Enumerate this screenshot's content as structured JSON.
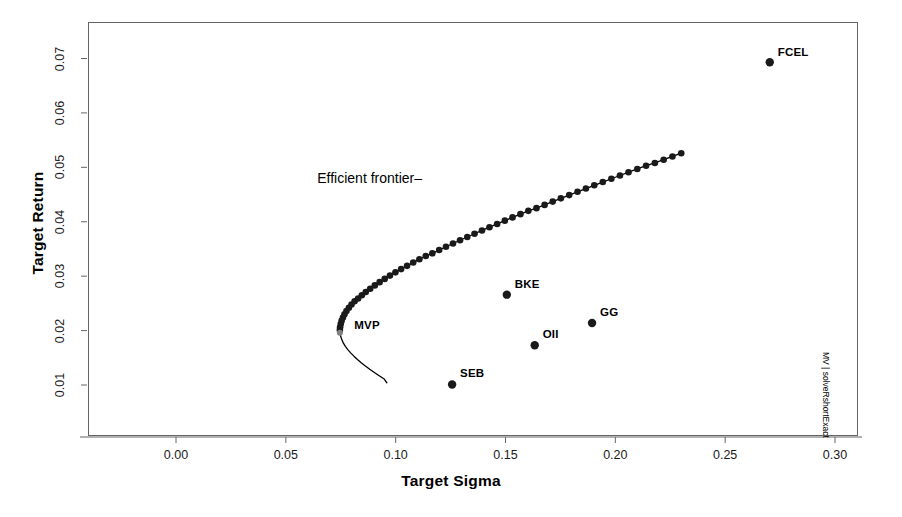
{
  "chart_data": {
    "type": "scatter",
    "title": "",
    "xlabel": "Target Sigma",
    "ylabel": "Target Return",
    "xlim": [
      -0.0398,
      0.3085
    ],
    "ylim": [
      0.0042,
      0.0742
    ],
    "xticks": [
      0.0,
      0.05,
      0.1,
      0.15,
      0.2,
      0.25,
      0.3
    ],
    "xticklabels": [
      "0.00",
      "0.05",
      "0.10",
      "0.15",
      "0.20",
      "0.25",
      "0.30"
    ],
    "yticks": [
      0.01,
      0.02,
      0.03,
      0.04,
      0.05,
      0.06,
      0.07
    ],
    "yticklabels": [
      "0.01",
      "0.02",
      "0.03",
      "0.04",
      "0.05",
      "0.06",
      "0.07"
    ],
    "grid": false,
    "legend": "none",
    "point_color": "#1a1a1a",
    "line_color": "#000000",
    "annotations": [
      {
        "name": "efficient-frontier-annotation",
        "text": "Efficient frontier–",
        "x": 0.112,
        "y": 0.0476,
        "anchor": "end"
      },
      {
        "name": "mvp-annotation",
        "text": "MVP",
        "x": 0.0775,
        "y": 0.0207,
        "anchor": "start"
      },
      {
        "name": "side-caption",
        "text": "MV | solveRshortExact"
      }
    ],
    "series": [
      {
        "name": "Efficient frontier",
        "kind": "line-with-markers",
        "marker": "filled-circle",
        "points": [
          [
            0.0746,
            0.0201
          ],
          [
            0.0747,
            0.0206
          ],
          [
            0.075,
            0.0212
          ],
          [
            0.0754,
            0.0218
          ],
          [
            0.076,
            0.0224
          ],
          [
            0.0767,
            0.023
          ],
          [
            0.0776,
            0.0236
          ],
          [
            0.0787,
            0.0242
          ],
          [
            0.0799,
            0.0248
          ],
          [
            0.0813,
            0.0254
          ],
          [
            0.0829,
            0.0259
          ],
          [
            0.0846,
            0.0265
          ],
          [
            0.0864,
            0.0271
          ],
          [
            0.0884,
            0.0277
          ],
          [
            0.0905,
            0.0283
          ],
          [
            0.0927,
            0.0289
          ],
          [
            0.095,
            0.0295
          ],
          [
            0.0974,
            0.0301
          ],
          [
            0.0999,
            0.0307
          ],
          [
            0.1025,
            0.0313
          ],
          [
            0.1052,
            0.0319
          ],
          [
            0.108,
            0.0325
          ],
          [
            0.1108,
            0.0331
          ],
          [
            0.1137,
            0.0337
          ],
          [
            0.1167,
            0.0342
          ],
          [
            0.1198,
            0.0348
          ],
          [
            0.1229,
            0.0354
          ],
          [
            0.1261,
            0.036
          ],
          [
            0.1293,
            0.0366
          ],
          [
            0.1326,
            0.0372
          ],
          [
            0.1359,
            0.0378
          ],
          [
            0.1393,
            0.0384
          ],
          [
            0.1427,
            0.039
          ],
          [
            0.1462,
            0.0396
          ],
          [
            0.1497,
            0.0402
          ],
          [
            0.1532,
            0.0408
          ],
          [
            0.1568,
            0.0414
          ],
          [
            0.1604,
            0.042
          ],
          [
            0.1641,
            0.0425
          ],
          [
            0.1678,
            0.0431
          ],
          [
            0.1715,
            0.0437
          ],
          [
            0.1752,
            0.0443
          ],
          [
            0.179,
            0.0449
          ],
          [
            0.1828,
            0.0455
          ],
          [
            0.1866,
            0.0461
          ],
          [
            0.1904,
            0.0467
          ],
          [
            0.1943,
            0.0473
          ],
          [
            0.1982,
            0.0479
          ],
          [
            0.2021,
            0.0485
          ],
          [
            0.206,
            0.0491
          ],
          [
            0.21,
            0.0497
          ],
          [
            0.214,
            0.0503
          ],
          [
            0.218,
            0.0508
          ],
          [
            0.222,
            0.0514
          ],
          [
            0.226,
            0.052
          ],
          [
            0.23,
            0.0526
          ],
          [
            0.2341,
            0.0532
          ],
          [
            0.2382,
            0.0538
          ],
          [
            0.2423,
            0.0544
          ],
          [
            0.2464,
            0.055
          ],
          [
            0.2505,
            0.0556
          ],
          [
            0.2546,
            0.0562
          ],
          [
            0.2588,
            0.0568
          ],
          [
            0.263,
            0.0574
          ],
          [
            0.2672,
            0.058
          ],
          [
            0.2714,
            0.0586
          ],
          [
            0.2756,
            0.0591
          ],
          [
            0.2798,
            0.0597
          ],
          [
            0.284,
            0.0603
          ],
          [
            0.2883,
            0.0609
          ],
          [
            0.2926,
            0.0615
          ],
          [
            0.2969,
            0.0621
          ],
          [
            0.3012,
            0.0627
          ],
          [
            0.3055,
            0.0633
          ],
          [
            0.3098,
            0.0639
          ],
          [
            0.3141,
            0.0645
          ],
          [
            0.3184,
            0.0651
          ],
          [
            0.3228,
            0.0657
          ],
          [
            0.3272,
            0.0663
          ],
          [
            0.3316,
            0.0669
          ],
          [
            0.336,
            0.0674
          ],
          [
            0.3404,
            0.068
          ],
          [
            0.3448,
            0.0686
          ],
          [
            0.3492,
            0.0692
          ]
        ]
      },
      {
        "name": "Inefficient frontier branch",
        "kind": "line",
        "points": [
          [
            0.0746,
            0.0201
          ],
          [
            0.0747,
            0.0195
          ],
          [
            0.075,
            0.0189
          ],
          [
            0.0755,
            0.0183
          ],
          [
            0.0762,
            0.0177
          ],
          [
            0.0771,
            0.0171
          ],
          [
            0.0782,
            0.0165
          ],
          [
            0.0795,
            0.0159
          ],
          [
            0.081,
            0.0153
          ],
          [
            0.0826,
            0.0147
          ],
          [
            0.0843,
            0.0141
          ],
          [
            0.0862,
            0.0135
          ],
          [
            0.0882,
            0.0129
          ],
          [
            0.0903,
            0.0123
          ],
          [
            0.0925,
            0.0117
          ],
          [
            0.0948,
            0.0111
          ],
          [
            0.096,
            0.0104
          ]
        ]
      },
      {
        "name": "Assets",
        "kind": "markers",
        "marker": "filled-circle",
        "points": [
          {
            "label": "FCEL",
            "x": 0.2703,
            "y": 0.0693,
            "label_dx": 8,
            "label_dy": -8
          },
          {
            "label": "BKE",
            "x": 0.1506,
            "y": 0.0266,
            "label_dx": 8,
            "label_dy": -9
          },
          {
            "label": "GG",
            "x": 0.1894,
            "y": 0.0214,
            "label_dx": 8,
            "label_dy": -9
          },
          {
            "label": "OII",
            "x": 0.1633,
            "y": 0.0173,
            "label_dx": 8,
            "label_dy": -9
          },
          {
            "label": "SEB",
            "x": 0.1257,
            "y": 0.0101,
            "label_dx": 8,
            "label_dy": -9
          }
        ]
      },
      {
        "name": "MVP marker",
        "kind": "markers",
        "marker": "filled-circle-grey",
        "color": "#808080",
        "points": [
          {
            "label": "",
            "x": 0.0746,
            "y": 0.0196
          }
        ]
      }
    ]
  },
  "axes": {
    "x_title": "Target Sigma",
    "y_title": "Target Return"
  },
  "side_caption": "MV | solveRshortExact"
}
